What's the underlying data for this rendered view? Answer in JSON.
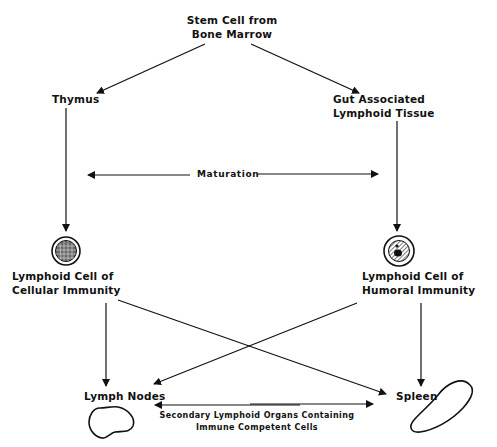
{
  "diagram": {
    "nodes": {
      "stem_cell": {
        "line1": "Stem Cell from",
        "line2": "Bone Marrow"
      },
      "thymus": {
        "label": "Thymus"
      },
      "galt": {
        "line1": "Gut Associated",
        "line2": "Lymphoid Tissue"
      },
      "cellular": {
        "line1": "Lymphoid Cell of",
        "line2": "Cellular Immunity"
      },
      "humoral": {
        "line1": "Lymphoid Cell of",
        "line2": "Humoral Immunity"
      },
      "lymph_nodes": {
        "label": "Lymph Nodes"
      },
      "spleen": {
        "label": "Spleen"
      }
    },
    "annotations": {
      "maturation": "Maturation",
      "secondary_line1": "Secondary Lymphoid Organs Containing",
      "secondary_line2": "Immune Competent Cells"
    },
    "edges": [
      {
        "from": "stem_cell",
        "to": "thymus"
      },
      {
        "from": "stem_cell",
        "to": "galt"
      },
      {
        "from": "thymus",
        "to": "cellular"
      },
      {
        "from": "galt",
        "to": "humoral"
      },
      {
        "from": "cellular",
        "to": "lymph_nodes"
      },
      {
        "from": "cellular",
        "to": "spleen"
      },
      {
        "from": "humoral",
        "to": "lymph_nodes"
      },
      {
        "from": "humoral",
        "to": "spleen"
      }
    ],
    "colors": {
      "ink": "#111111",
      "background": "#ffffff"
    }
  }
}
